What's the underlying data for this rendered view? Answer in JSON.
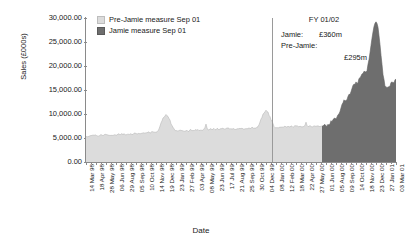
{
  "chart_data": {
    "type": "area",
    "title": "",
    "xlabel": "Date",
    "ylabel": "Sales (£000s)",
    "ylim": [
      0,
      30000
    ],
    "ytick_labels": [
      "30,000.00",
      "25,000.00",
      "20,000.00",
      "15,000.00",
      "10,000.00",
      "5,000.00",
      "0.00"
    ],
    "ytick_values": [
      30000,
      25000,
      20000,
      15000,
      10000,
      5000,
      0
    ],
    "grid": false,
    "legend_position": "top-left",
    "legend": [
      "Pre-Jamie measure Sep 01",
      "Jamie measure Sep 01"
    ],
    "colors": {
      "pre_jamie": "#dcdcdc",
      "jamie": "#6e6e6e",
      "axis": "#8a8a8a",
      "divider": "#9a9a9a",
      "text": "#1a1a1a"
    },
    "categories": [
      "14 Mar 98",
      "18 Apr 98",
      "28 May 98",
      "06 Jun 98",
      "29 Aug 98",
      "05 Sep 98",
      "10 Oct 98",
      "14 Nov 98",
      "19 Dec 98",
      "23 Jan 99",
      "27 Feb 99",
      "03 Apr 99",
      "08 May 99",
      "23 Jun 99",
      "17 Jul 99",
      "21 Aug 99",
      "25 Sep 99",
      "30 Oct 99",
      "04 Dec 99",
      "08 Jan 00",
      "12 Feb 00",
      "18 Mar 00",
      "22 Apr 00",
      "27 May 00",
      "01 Jun 00",
      "05 Aug 00",
      "09 Sep 00",
      "14 Oct 00",
      "18 Nov 00",
      "23 Dec 00",
      "27 Jan 01",
      "03 Mar 01"
    ],
    "series": [
      {
        "name": "Pre-Jamie measure Sep 01",
        "values": [
          5300,
          5500,
          5600,
          5700,
          5800,
          5900,
          6000,
          6300,
          9700,
          6400,
          6500,
          6600,
          6700,
          6800,
          6900,
          6900,
          7000,
          7100,
          10600,
          7200,
          7300,
          7400,
          7400,
          7500,
          7500,
          7600,
          7700,
          7800,
          7900,
          8000,
          6200,
          6000
        ]
      },
      {
        "name": "Jamie measure Sep 01",
        "values": [
          null,
          null,
          null,
          null,
          null,
          null,
          null,
          null,
          null,
          null,
          null,
          null,
          null,
          null,
          null,
          null,
          null,
          null,
          null,
          null,
          null,
          null,
          null,
          null,
          7600,
          9200,
          13000,
          16500,
          19000,
          29200,
          15500,
          17000
        ]
      }
    ],
    "annotations": {
      "fy_label": "FY 01/02",
      "jamie_key": "Jamie:",
      "jamie_value": "£360m",
      "pre_jamie_key": "Pre-Jamie:",
      "pre_jamie_value": "£295m"
    }
  }
}
